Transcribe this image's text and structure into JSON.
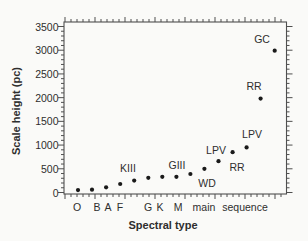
{
  "chart_data": {
    "type": "scatter",
    "title": "",
    "xlabel": "Spectral type",
    "ylabel": "Scale height (pc)",
    "ylim": [
      0,
      3500
    ],
    "y_ticks": [
      0,
      500,
      1000,
      1500,
      2000,
      2500,
      3000,
      3500
    ],
    "y_minor_step": 100,
    "grid": "off",
    "legend": "none",
    "x_category_labels": [
      {
        "text": "O",
        "x": 77
      },
      {
        "text": "B",
        "x": 97
      },
      {
        "text": "A",
        "x": 108
      },
      {
        "text": "F",
        "x": 120
      },
      {
        "text": "G",
        "x": 148
      },
      {
        "text": "K",
        "x": 160
      },
      {
        "text": "M",
        "x": 178
      },
      {
        "text": "main",
        "x": 204
      },
      {
        "text": "sequence",
        "x": 245
      }
    ],
    "points": [
      {
        "label": "O",
        "slot": 0,
        "value": 50
      },
      {
        "label": "B",
        "slot": 1,
        "value": 60
      },
      {
        "label": "A",
        "slot": 2,
        "value": 110
      },
      {
        "label": "F",
        "slot": 3,
        "value": 180
      },
      {
        "label": "KIII",
        "slot": 4,
        "value": 250
      },
      {
        "label": "G",
        "slot": 5,
        "value": 310
      },
      {
        "label": "K",
        "slot": 6,
        "value": 330
      },
      {
        "label": "M",
        "slot": 7,
        "value": 330
      },
      {
        "label": "GIII",
        "slot": 8,
        "value": 390
      },
      {
        "label": "WD",
        "slot": 9,
        "value": 500
      },
      {
        "label": "LPV",
        "slot": 10,
        "value": 660
      },
      {
        "label": "RR",
        "slot": 11,
        "value": 850
      },
      {
        "label": "LPV",
        "slot": 12,
        "value": 950
      },
      {
        "label": "RR",
        "slot": 13,
        "value": 1980
      },
      {
        "label": "GC",
        "slot": 14,
        "value": 2990
      }
    ],
    "annotations": [
      {
        "text": "KIII",
        "x": 128,
        "y": 168
      },
      {
        "text": "GIII",
        "x": 177,
        "y": 165
      },
      {
        "text": "WD",
        "x": 207,
        "y": 183
      },
      {
        "text": "LPV",
        "x": 216,
        "y": 150
      },
      {
        "text": "RR",
        "x": 237,
        "y": 167
      },
      {
        "text": "LPV",
        "x": 252,
        "y": 134
      },
      {
        "text": "RR",
        "x": 254,
        "y": 86
      },
      {
        "text": "GC",
        "x": 262,
        "y": 39
      }
    ],
    "colors": {
      "background": "#fafaf8",
      "frame": "#4f4f4f",
      "point": "#1a1a1a",
      "text": "#2e2e2e"
    }
  }
}
